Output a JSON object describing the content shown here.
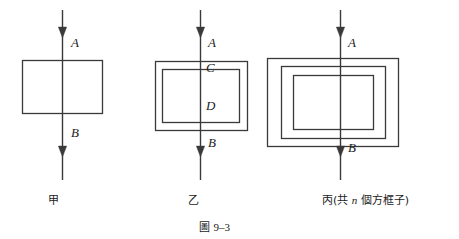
{
  "figure": {
    "caption_prefix": "圖",
    "caption_number": "9–3",
    "background_color": "#ffffff",
    "line_color": "#3a3a3a",
    "text_color": "#1a1a1a"
  },
  "panels": [
    {
      "id": "jia",
      "name": "甲",
      "label": "甲",
      "box_count": 1,
      "arrow_x": 62,
      "arrow_top": 10,
      "arrow_bottom": 180,
      "arrowheads_y": [
        38,
        157
      ],
      "boxes": [
        {
          "x": 22,
          "y": 60,
          "w": 80,
          "h": 53
        }
      ],
      "point_labels": [
        {
          "text": "A",
          "x": 71,
          "y": 36
        },
        {
          "text": "B",
          "x": 71,
          "y": 126
        }
      ],
      "label_x": 48,
      "label_y": 195
    },
    {
      "id": "yi",
      "name": "乙",
      "label": "乙",
      "box_count": 2,
      "arrow_x": 200,
      "arrow_top": 10,
      "arrow_bottom": 180,
      "arrowheads_y": [
        38,
        157
      ],
      "boxes": [
        {
          "x": 155,
          "y": 61,
          "w": 92,
          "h": 69
        },
        {
          "x": 162,
          "y": 69,
          "w": 77,
          "h": 53
        }
      ],
      "point_labels": [
        {
          "text": "A",
          "x": 208,
          "y": 36
        },
        {
          "text": "C",
          "x": 206,
          "y": 61
        },
        {
          "text": "D",
          "x": 206,
          "y": 99
        },
        {
          "text": "B",
          "x": 208,
          "y": 136
        }
      ],
      "label_x": 188,
      "label_y": 195
    },
    {
      "id": "bing",
      "name": "丙",
      "label": "丙(共 n 個方框子)",
      "label_parts": {
        "before": "丙(共 ",
        "italic": "n",
        "after": " 個方框子)"
      },
      "box_count": 3,
      "arrow_x": 340,
      "arrow_top": 10,
      "arrow_bottom": 180,
      "arrowheads_y": [
        38,
        157
      ],
      "boxes": [
        {
          "x": 267,
          "y": 58,
          "w": 131,
          "h": 88
        },
        {
          "x": 281,
          "y": 66,
          "w": 104,
          "h": 72
        },
        {
          "x": 293,
          "y": 75,
          "w": 80,
          "h": 54
        }
      ],
      "point_labels": [
        {
          "text": "A",
          "x": 348,
          "y": 36
        },
        {
          "text": "B",
          "x": 348,
          "y": 141
        }
      ],
      "label_x": 322,
      "label_y": 195
    }
  ],
  "caption": {
    "x": 199,
    "y": 222
  }
}
